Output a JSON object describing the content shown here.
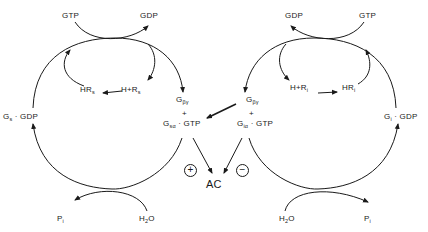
{
  "diagram": {
    "left_cycle": {
      "gtp": "GTP",
      "gdp": "GDP",
      "hormone_receptor_complex": {
        "base": "HR",
        "sub": "s"
      },
      "hormone_plus_receptor": {
        "base": "H+R",
        "sub": "s"
      },
      "inactive": {
        "base": "G",
        "sub": "s",
        "rest": " · GDP"
      },
      "beta_gamma": {
        "base": "G",
        "sub": "βγ"
      },
      "plus": "+",
      "active": {
        "base": "G",
        "sub": "sα",
        "rest": " · GTP"
      },
      "pi": {
        "base": "P",
        "sub": "i"
      },
      "water": {
        "base": "H",
        "sub": "2",
        "rest": "O"
      }
    },
    "right_cycle": {
      "gtp": "GTP",
      "gdp": "GDP",
      "hormone_receptor_complex": {
        "base": "HR",
        "sub": "i"
      },
      "hormone_plus_receptor": {
        "base": "H+R",
        "sub": "i"
      },
      "inactive": {
        "base": "G",
        "sub": "i",
        "rest": " · GDP"
      },
      "beta_gamma": {
        "base": "G",
        "sub": "βγ"
      },
      "plus": "+",
      "active": {
        "base": "G",
        "sub": "iα",
        "rest": " · GTP"
      },
      "pi": {
        "base": "P",
        "sub": "i"
      },
      "water": {
        "base": "H",
        "sub": "2",
        "rest": "O"
      }
    },
    "effector": "AC",
    "stimulation_sign": "+",
    "inhibition_sign": "−"
  }
}
